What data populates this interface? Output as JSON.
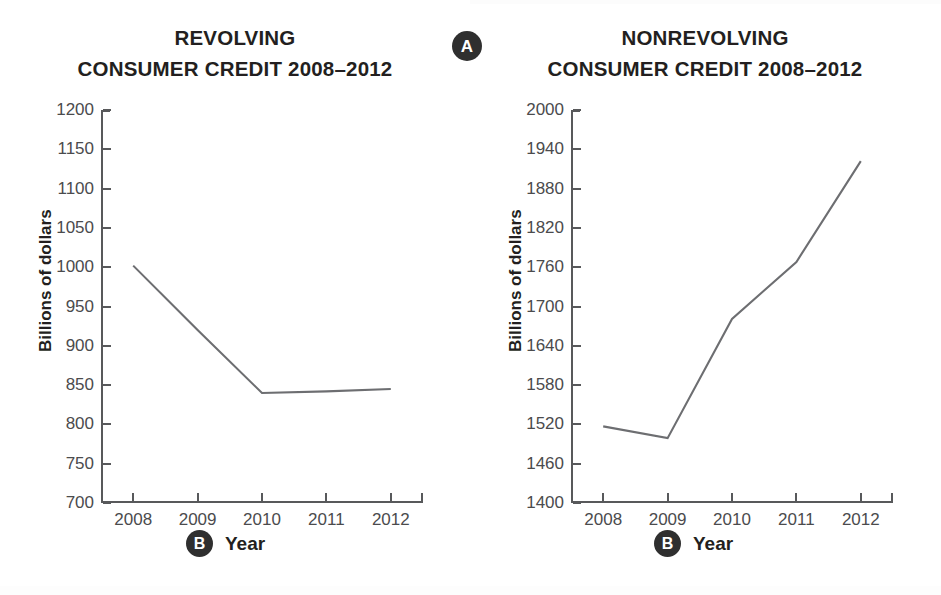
{
  "chart_data": [
    {
      "type": "line",
      "panel_label": "A",
      "title": "REVOLVING\nCONSUMER CREDIT 2008–2012",
      "title_line1": "REVOLVING",
      "title_line2": "CONSUMER CREDIT 2008–2012",
      "xlabel": "Year",
      "ylabel": "Billions of dollars",
      "x": [
        2008,
        2009,
        2010,
        2011,
        2012
      ],
      "xticklabels": [
        "2008",
        "2009",
        "2010",
        "2011",
        "2012"
      ],
      "values": [
        1002,
        920,
        840,
        842,
        845
      ],
      "yticks": [
        700,
        750,
        800,
        850,
        900,
        950,
        1000,
        1050,
        1100,
        1150,
        1200
      ],
      "yticklabels": [
        "700",
        "750",
        "800",
        "850",
        "900",
        "950",
        "1000",
        "1050",
        "1100",
        "1150",
        "1200"
      ],
      "ylim": [
        700,
        1200
      ],
      "grid": false,
      "legend": false,
      "line_color": "#6d6e71",
      "axis_color": "#58595b"
    },
    {
      "type": "line",
      "panel_label": "B",
      "title": "NONREVOLVING\nCONSUMER CREDIT 2008–2012",
      "title_line1": "NONREVOLVING",
      "title_line2": "CONSUMER CREDIT 2008–2012",
      "xlabel": "Year",
      "ylabel": "Billions of dollars",
      "x": [
        2008,
        2009,
        2010,
        2011,
        2012
      ],
      "xticklabels": [
        "2008",
        "2009",
        "2010",
        "2011",
        "2012"
      ],
      "values": [
        1517,
        1499,
        1681,
        1768,
        1922
      ],
      "yticks": [
        1400,
        1460,
        1520,
        1580,
        1640,
        1700,
        1760,
        1820,
        1880,
        1940,
        2000
      ],
      "yticklabels": [
        "1400",
        "1460",
        "1520",
        "1580",
        "1640",
        "1700",
        "1760",
        "1820",
        "1880",
        "1940",
        "2000"
      ],
      "ylim": [
        1400,
        2000
      ],
      "grid": false,
      "legend": false,
      "line_color": "#6d6e71",
      "axis_color": "#58595b"
    }
  ],
  "badges": {
    "panel_a": "A",
    "panel_b_left": "B",
    "panel_b_right": "B"
  },
  "colors": {
    "ink": "#231f20",
    "tick_text": "#4b4b4d",
    "axis": "#58595b",
    "line": "#6d6e71",
    "badge_bg": "#2f2f2f",
    "badge_text": "#ffffff",
    "background": "#ffffff"
  }
}
